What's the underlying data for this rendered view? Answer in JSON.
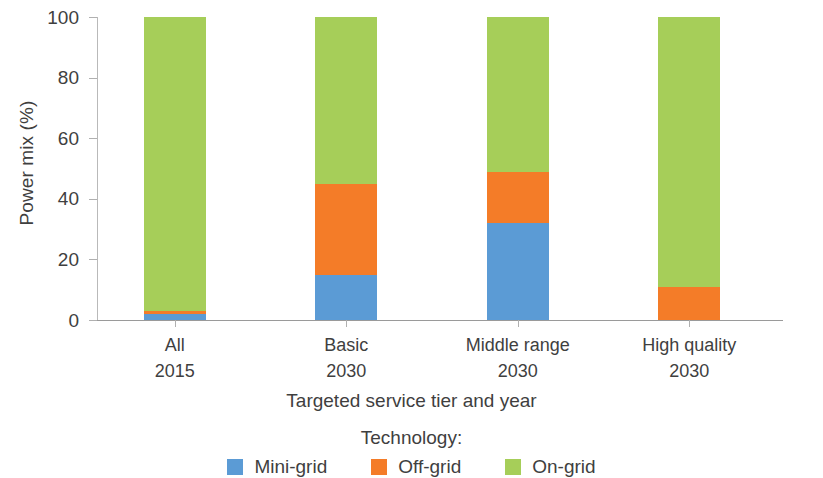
{
  "chart_data": {
    "type": "bar",
    "subtype": "stacked-bar-100-percent",
    "title": "",
    "xlabel": "Targeted service tier and year",
    "ylabel": "Power mix (%)",
    "ylim": [
      0,
      100
    ],
    "yticks": [
      0,
      20,
      40,
      60,
      80,
      100
    ],
    "ytick_labels": [
      "0",
      "20",
      "40",
      "60",
      "80",
      "100"
    ],
    "grid": false,
    "legend_position": "bottom",
    "legend_title": "Technology:",
    "categories": [
      "All\n2015",
      "Basic\n2030",
      "Middle range\n2030",
      "High quality\n2030"
    ],
    "category_lines": [
      [
        "All",
        "2015"
      ],
      [
        "Basic",
        "2030"
      ],
      [
        "Middle range",
        "2030"
      ],
      [
        "High quality",
        "2030"
      ]
    ],
    "series": [
      {
        "name": "Mini-grid",
        "color": "#5B9BD5",
        "values": [
          2,
          15,
          32,
          0
        ]
      },
      {
        "name": "Off-grid",
        "color": "#F47C28",
        "values": [
          1,
          30,
          17,
          11
        ]
      },
      {
        "name": "On-grid",
        "color": "#A6CE59",
        "values": [
          97,
          55,
          51,
          89
        ]
      }
    ]
  },
  "axes": {
    "y_title": "Power mix (%)",
    "x_title": "Targeted service tier and year"
  },
  "legend": {
    "title": "Technology:",
    "items": [
      {
        "label": "Mini-grid",
        "color": "#5B9BD5"
      },
      {
        "label": "Off-grid",
        "color": "#F47C28"
      },
      {
        "label": "On-grid",
        "color": "#A6CE59"
      }
    ]
  }
}
